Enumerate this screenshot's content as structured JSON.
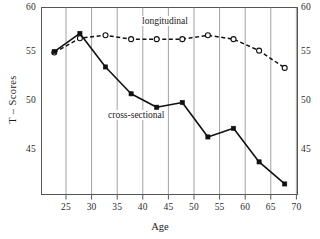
{
  "chart_data": {
    "type": "line",
    "title": "",
    "xlabel": "Age",
    "ylabel": "T – Scores",
    "x": [
      25,
      30,
      35,
      40,
      45,
      50,
      55,
      60,
      65,
      70
    ],
    "xlim": [
      22.5,
      72.5
    ],
    "ylim": [
      40.5,
      60.0
    ],
    "xticks": [
      25,
      30,
      35,
      40,
      45,
      50,
      55,
      60,
      65,
      70
    ],
    "xtick_labels": [
      "25",
      "30",
      "35",
      "40",
      "45",
      "50",
      "55",
      "60",
      "65",
      "70"
    ],
    "yticks": [
      45,
      50,
      55,
      60
    ],
    "ytick_labels_left": [
      "60",
      "55",
      "50",
      "45"
    ],
    "ytick_labels_right": [
      "60",
      "55",
      "50",
      "45"
    ],
    "grid": "vertical-only",
    "legend_position": "inline-annotation",
    "series": [
      {
        "name": "longitudinal",
        "label": "longitudinal",
        "linestyle": "dashed",
        "marker": "open-circle",
        "color": "#111111",
        "values": [
          55.3,
          56.8,
          57.1,
          56.7,
          56.7,
          56.7,
          57.1,
          56.7,
          55.5,
          53.7
        ]
      },
      {
        "name": "cross-sectional",
        "label": "cross-sectional",
        "linestyle": "solid",
        "marker": "filled-square",
        "color": "#111111",
        "values": [
          55.4,
          57.3,
          53.8,
          51.0,
          49.6,
          50.1,
          46.5,
          47.4,
          43.9,
          41.6
        ]
      }
    ]
  },
  "annotations": {
    "longitudinal": "longitudinal",
    "cross_sectional": "cross-sectional"
  },
  "colors": {
    "frame": "#555555",
    "gridline": "#8a8a8a",
    "ink": "#111111",
    "background": "#ffffff"
  }
}
